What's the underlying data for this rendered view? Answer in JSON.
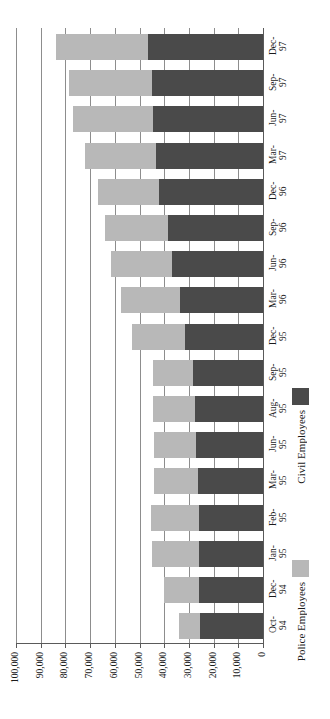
{
  "chart_data": {
    "type": "bar",
    "orientation": "horizontal-stacked",
    "title": "",
    "subtitle": "",
    "xlabel": "",
    "ylabel": "",
    "stacked": true,
    "grid": true,
    "axis_reversed": true,
    "value_axis_note": "Value axis reads 100,000 at left to 0 at right; bars grow leftward from the zero baseline.",
    "legend_position": "bottom-right",
    "xlim": [
      0,
      100000
    ],
    "ticks": [
      100000,
      90000,
      80000,
      70000,
      60000,
      50000,
      40000,
      30000,
      20000,
      10000,
      0
    ],
    "tick_labels": [
      "100,000",
      "90,000",
      "80,000",
      "70,000",
      "60,000",
      "50,000",
      "40,000",
      "30,000",
      "20,000",
      "10,000",
      "0"
    ],
    "categories": [
      "Dec-\n97",
      "Sep-\n97",
      "Jun-\n97",
      "Mar-\n97",
      "Dec-\n96",
      "Sep-\n96",
      "Jun-\n96",
      "Mar-\n96",
      "Dec-\n95",
      "Sep-\n95",
      "Aug-\n95",
      "Jun-\n95",
      "Mar-\n95",
      "Feb-\n95",
      "Jan-\n95",
      "Dec-\n94",
      "Oct-\n94"
    ],
    "series": [
      {
        "name": "Police Employees",
        "color": "#b8b8b8",
        "values": [
          37500,
          33500,
          32500,
          28500,
          25000,
          25500,
          24500,
          24000,
          21500,
          16000,
          17000,
          17000,
          17500,
          19500,
          19000,
          14000,
          8500
        ]
      },
      {
        "name": "Civil Employees",
        "color": "#4a4a4a",
        "values": [
          46500,
          45000,
          44500,
          43500,
          42000,
          38500,
          37000,
          33500,
          31500,
          28500,
          27500,
          27000,
          26500,
          26000,
          26000,
          26000,
          25500
        ]
      }
    ],
    "totals": [
      84000,
      78500,
      77000,
      72000,
      67000,
      64000,
      61500,
      57500,
      53000,
      44500,
      44500,
      44000,
      44000,
      45500,
      45000,
      40000,
      34000
    ]
  },
  "legend": {
    "entries": [
      {
        "label": "Police Employees",
        "color": "#b8b8b8"
      },
      {
        "label": "Civil Employees",
        "color": "#4a4a4a"
      }
    ]
  },
  "colors": {
    "police": "#b8b8b8",
    "civil": "#4a4a4a",
    "grid": "#8d8d8d",
    "axis": "#5a5a5a",
    "background": "#ffffff",
    "text": "#1a1a1a"
  }
}
